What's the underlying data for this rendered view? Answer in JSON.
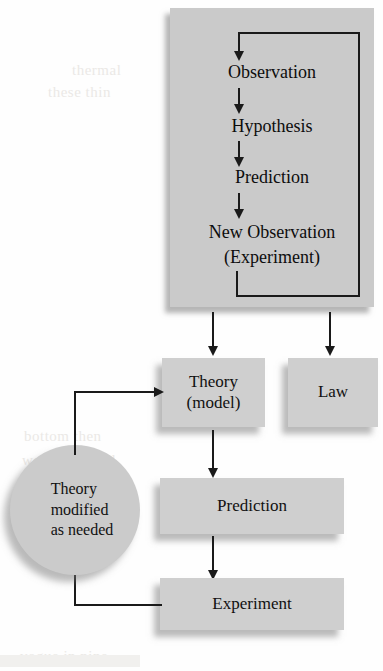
{
  "figure": {
    "type": "flowchart",
    "colors": {
      "panel_fill": "#cacaca",
      "box_fill": "#cfcfcf",
      "circle_fill": "#cbcbcb",
      "line": "#1a1a1a",
      "text": "#0d0d0d",
      "background": "#fefefe",
      "shadow": "rgba(120,120,120,0.5)"
    }
  },
  "panel": {
    "steps": [
      {
        "label": "Observation"
      },
      {
        "label": "Hypothesis"
      },
      {
        "label": "Prediction"
      },
      {
        "label": "New Observation",
        "label_line2": "(Experiment)"
      }
    ]
  },
  "boxes": {
    "theory": {
      "label": "Theory",
      "label_line2": "(model)"
    },
    "law": {
      "label": "Law"
    },
    "prediction": {
      "label": "Prediction"
    },
    "experiment": {
      "label": "Experiment"
    }
  },
  "circle": {
    "line1": "Theory",
    "line2": "modified",
    "line3": "as needed"
  },
  "connectors": [
    {
      "name": "observation-to-hypothesis",
      "kind": "arrow-down"
    },
    {
      "name": "hypothesis-to-prediction",
      "kind": "arrow-down"
    },
    {
      "name": "prediction-to-new-observation",
      "kind": "arrow-down"
    },
    {
      "name": "new-observation-feedback-loop",
      "kind": "loop-arrow-up-into-observation"
    },
    {
      "name": "panel-to-theory",
      "kind": "arrow-down"
    },
    {
      "name": "panel-to-law",
      "kind": "arrow-down"
    },
    {
      "name": "theory-to-prediction",
      "kind": "arrow-down"
    },
    {
      "name": "prediction-to-experiment",
      "kind": "arrow-down"
    },
    {
      "name": "experiment-to-theory-modified",
      "kind": "feedback-path"
    },
    {
      "name": "theory-modified-to-theory",
      "kind": "arrow-right"
    }
  ],
  "ghost_text": {
    "line1": "thermal",
    "line2": "these thin",
    "line3": "bottom then",
    "line4": "would be tried",
    "line5": "vogue in nine"
  }
}
